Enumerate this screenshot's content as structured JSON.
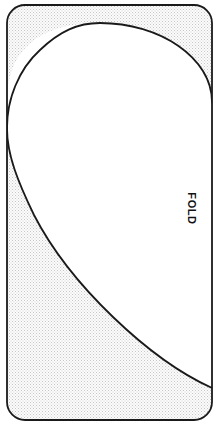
{
  "diagram": {
    "canvas": {
      "width": 221,
      "height": 436,
      "background": "#ffffff"
    },
    "labels": {
      "fold": "FOLD"
    },
    "colors": {
      "outline": "#1a1a1a",
      "shaded_fill": "#ededed",
      "stipple_dot": "#c9c9c9",
      "white_fill": "#ffffff",
      "label_text": "#111111"
    },
    "card": {
      "name": "rounded-card",
      "x": 7,
      "y": 5,
      "width": 205,
      "height": 415,
      "corner_radius": 18,
      "stroke_width": 1.8
    },
    "teardrop": {
      "name": "white-teardrop-region",
      "apex": [
        100,
        23
      ],
      "left_tangent": [
        7,
        135
      ],
      "right_edge_top": [
        212,
        102
      ],
      "right_edge_bottom": [
        212,
        388
      ],
      "left_edge_bottom": [
        7,
        196
      ]
    },
    "shaded_regions": [
      {
        "name": "top-left-shaded-corner"
      },
      {
        "name": "top-right-shaded-corner"
      },
      {
        "name": "bottom-shaded-wedge"
      }
    ],
    "label_positions": {
      "fold": {
        "x": 191,
        "y": 208,
        "rotation_deg": 90
      }
    }
  }
}
